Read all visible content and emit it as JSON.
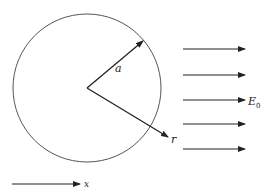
{
  "diagram": {
    "sphere": {
      "cx": 87,
      "cy": 88,
      "r": 74,
      "stroke": "#555555"
    },
    "radius_vector": {
      "label": "a",
      "x1": 87,
      "y1": 88,
      "x2": 143,
      "y2": 41
    },
    "position_vector": {
      "label": "r",
      "x1": 87,
      "y1": 88,
      "x2": 168,
      "y2": 137
    },
    "field_arrows": {
      "label": "E",
      "subscript": "0",
      "x1": 183,
      "x2": 245,
      "ys": [
        49,
        75,
        100,
        124,
        149
      ],
      "label_row": 2
    },
    "axis": {
      "label": "x",
      "x1": 12,
      "x2": 80,
      "y": 184
    }
  }
}
